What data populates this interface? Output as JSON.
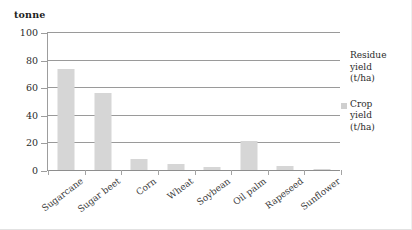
{
  "chart_data": {
    "type": "bar",
    "title": "",
    "subtitle": "",
    "unit_caption": "tonne",
    "xlabel": "",
    "ylabel": "",
    "ylim": [
      0,
      100
    ],
    "yticks": [
      0,
      20,
      40,
      60,
      80,
      100
    ],
    "ytick_labels": [
      "0",
      "20",
      "40",
      "60",
      "80",
      "100"
    ],
    "grid": true,
    "legend_position": "right",
    "categories": [
      "Sugarcane",
      "Sugar beet",
      "Corn",
      "Wheat",
      "Soybean",
      "Oil palm",
      "Rapeseed",
      "Sunflower"
    ],
    "series": [
      {
        "name": "Crop yield (t/ha)",
        "color": "#d6d6d6",
        "values": [
          73,
          56,
          8,
          4,
          2,
          21,
          3,
          1
        ]
      }
    ],
    "legend": [
      {
        "label": "Residue yield (t/ha)",
        "lines": [
          "Residue",
          "yield",
          "(t/ha)"
        ],
        "color": "#ffffff"
      },
      {
        "label": "Crop yield (t/ha)",
        "lines": [
          "Crop",
          "yield",
          "(t/ha)"
        ],
        "color": "#cfcfcf"
      }
    ]
  }
}
